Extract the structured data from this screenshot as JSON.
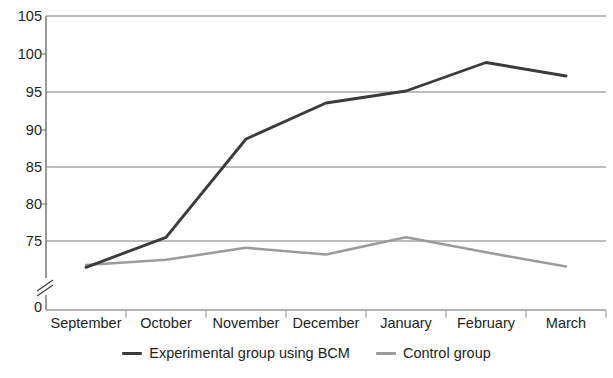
{
  "chart_data": {
    "type": "line",
    "title": "",
    "xlabel": "",
    "ylabel": "",
    "categories": [
      "September",
      "October",
      "November",
      "December",
      "January",
      "February",
      "March"
    ],
    "series": [
      {
        "name": "Experimental group using BCM",
        "color": "#3b3b3b",
        "values": [
          71.5,
          75.5,
          88.6,
          93.4,
          95.0,
          98.8,
          97.0
        ]
      },
      {
        "name": "Control group",
        "color": "#9b9b9b",
        "values": [
          71.8,
          72.5,
          74.1,
          73.2,
          75.5,
          73.5,
          71.6
        ]
      }
    ],
    "ylim": [
      70.6,
      105
    ],
    "y_ticks": [
      75,
      80,
      85,
      90,
      95,
      100,
      105
    ],
    "y_tick_labels": [
      "75",
      "80",
      "85",
      "90",
      "95",
      "100",
      "105"
    ],
    "y_gridlines": [
      75,
      85,
      95,
      105
    ],
    "y_origin_label": "0",
    "axis_break": true,
    "grid": true,
    "legend_position": "bottom"
  },
  "axis": {
    "y_labels": [
      "105",
      "100",
      "95",
      "90",
      "85",
      "80",
      "75",
      "0"
    ],
    "x_labels": [
      "September",
      "October",
      "November",
      "December",
      "January",
      "February",
      "March"
    ]
  },
  "legend": {
    "items": [
      {
        "label": "Experimental group using BCM",
        "color": "#3b3b3b"
      },
      {
        "label": "Control group",
        "color": "#9b9b9b"
      }
    ]
  },
  "colors": {
    "experimental": "#3b3b3b",
    "control": "#9b9b9b",
    "grid": "#7d7d7d",
    "axis": "#6f6f6f",
    "text": "#231f20"
  }
}
